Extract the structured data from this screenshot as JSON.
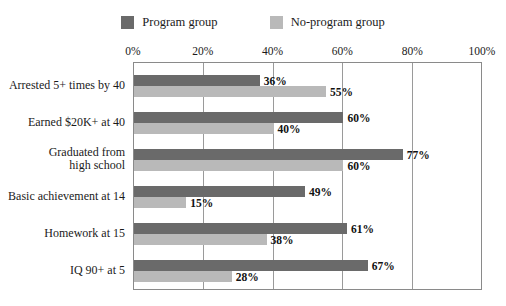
{
  "chart_data": {
    "type": "bar",
    "orientation": "horizontal",
    "title": "",
    "xlabel": "",
    "ylabel": "",
    "xlim": [
      0,
      100
    ],
    "xticks": [
      "0%",
      "20%",
      "40%",
      "60%",
      "80%",
      "100%"
    ],
    "xtick_values": [
      0,
      20,
      40,
      60,
      80,
      100
    ],
    "grid": true,
    "legend_position": "top",
    "categories": [
      "Arrested 5+ times by 40",
      "Earned $20K+ at 40",
      "Graduated from\nhigh school",
      "Basic achievement at 14",
      "Homework at 15",
      "IQ 90+ at 5"
    ],
    "series": [
      {
        "name": "Program group",
        "color": "#6a6a6a",
        "values": [
          36,
          60,
          77,
          49,
          61,
          67
        ],
        "labels": [
          "36%",
          "60%",
          "77%",
          "49%",
          "61%",
          "67%"
        ]
      },
      {
        "name": "No-program group",
        "color": "#b9b9b9",
        "values": [
          55,
          40,
          60,
          15,
          38,
          28
        ],
        "labels": [
          "55%",
          "40%",
          "60%",
          "15%",
          "38%",
          "28%"
        ]
      }
    ]
  },
  "legend": {
    "items": [
      {
        "label": "Program group",
        "color": "#6a6a6a",
        "swatch_name": "legend-swatch-program-group"
      },
      {
        "label": "No-program group",
        "color": "#b9b9b9",
        "swatch_name": "legend-swatch-no-program-group"
      }
    ]
  },
  "colors": {
    "program_group": "#6a6a6a",
    "no_program_group": "#b9b9b9",
    "plot_border": "#8a8a8a",
    "gridline": "#9a9a9a",
    "text": "#1a1a1a",
    "background": "#ffffff"
  }
}
